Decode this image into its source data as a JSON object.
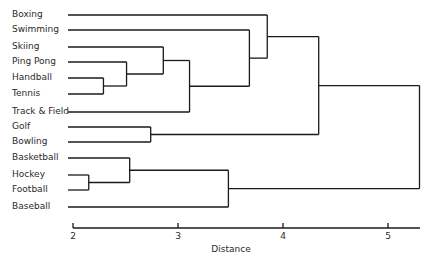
{
  "chart_data": {
    "type": "dendrogram",
    "title": "",
    "xlabel": "Distance",
    "ylabel": "",
    "xlim": [
      2,
      5.3
    ],
    "xticks": [
      2,
      3,
      4,
      5
    ],
    "grid": false,
    "leaves": [
      "Boxing",
      "Swimming",
      "Skiing",
      "Ping Pong",
      "Handball",
      "Tennis",
      "Track & Field",
      "Golf",
      "Bowling",
      "Basketball",
      "Hockey",
      "Football",
      "Baseball"
    ],
    "merges": [
      {
        "id": "m1",
        "children": [
          "Hockey",
          "Football"
        ],
        "distance": 2.15
      },
      {
        "id": "m2",
        "children": [
          "Handball",
          "Tennis"
        ],
        "distance": 2.29
      },
      {
        "id": "m3",
        "children": [
          "Ping Pong",
          "m2"
        ],
        "distance": 2.51
      },
      {
        "id": "m4",
        "children": [
          "Basketball",
          "m1"
        ],
        "distance": 2.54
      },
      {
        "id": "m5",
        "children": [
          "Golf",
          "Bowling"
        ],
        "distance": 2.74
      },
      {
        "id": "m6",
        "children": [
          "Skiing",
          "m3"
        ],
        "distance": 2.86
      },
      {
        "id": "m7",
        "children": [
          "m6",
          "Track & Field"
        ],
        "distance": 3.11
      },
      {
        "id": "m8",
        "children": [
          "m4",
          "Baseball"
        ],
        "distance": 3.48
      },
      {
        "id": "m9",
        "children": [
          "Swimming",
          "m7"
        ],
        "distance": 3.68
      },
      {
        "id": "m10",
        "children": [
          "Boxing",
          "m9"
        ],
        "distance": 3.85
      },
      {
        "id": "m11",
        "children": [
          "m10",
          "m5"
        ],
        "distance": 4.34
      },
      {
        "id": "m12",
        "children": [
          "m11",
          "m8"
        ],
        "distance": 5.3
      }
    ]
  },
  "layout": {
    "line_color": "#1a1a1a",
    "leaf_y": [
      15,
      30,
      47,
      62,
      78,
      94,
      112,
      127,
      142,
      158,
      175,
      190,
      207
    ],
    "leaf_x_start": 68,
    "x_origin_px": 73,
    "px_per_unit": 105,
    "axis_y": 228
  }
}
